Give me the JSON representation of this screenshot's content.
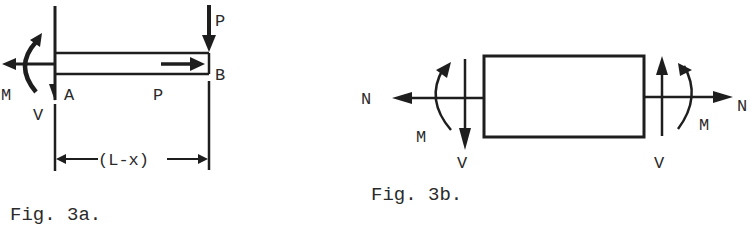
{
  "fig3a": {
    "caption": "Fig. 3a.",
    "labels": {
      "load_top": "P",
      "end_b": "B",
      "end_a": "A",
      "axial_load": "P",
      "moment": "M",
      "shear": "V",
      "dimension": "(L-x)"
    }
  },
  "fig3b": {
    "caption": "Fig. 3b.",
    "labels": {
      "left_normal": "N",
      "left_moment": "M",
      "left_shear": "V",
      "right_normal": "N",
      "right_moment": "M",
      "right_shear": "V"
    }
  }
}
